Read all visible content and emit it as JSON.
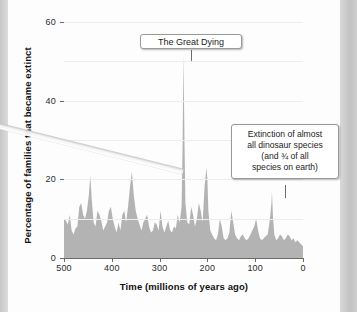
{
  "chart_data": {
    "type": "area",
    "title": "",
    "xlabel": "Time  (millions of years ago)",
    "ylabel": "Percentage of families that became extinct",
    "xlim": [
      500,
      0
    ],
    "ylim": [
      0,
      60
    ],
    "x_ticks": [
      "500",
      "400",
      "300",
      "200",
      "100",
      "0"
    ],
    "x_tick_values": [
      500,
      400,
      300,
      200,
      100,
      0
    ],
    "y_ticks": [
      "0",
      "20",
      "40",
      "60"
    ],
    "y_tick_values": [
      0,
      20,
      40,
      60
    ],
    "gridlines": [
      10,
      20,
      30,
      40,
      50,
      60
    ],
    "grid": true,
    "legend": "none",
    "series_name": "Extinction intensity",
    "fill_color": "#b3b3b3",
    "x": [
      500,
      496,
      492,
      488,
      484,
      480,
      476,
      472,
      468,
      464,
      460,
      456,
      452,
      448,
      445,
      442,
      438,
      434,
      430,
      426,
      422,
      418,
      414,
      410,
      406,
      402,
      398,
      394,
      390,
      386,
      382,
      378,
      374,
      370,
      366,
      362,
      358,
      354,
      350,
      346,
      342,
      338,
      334,
      330,
      326,
      322,
      318,
      314,
      310,
      306,
      302,
      298,
      294,
      290,
      286,
      282,
      278,
      274,
      270,
      266,
      262,
      258,
      254,
      252,
      250,
      248,
      246,
      242,
      238,
      234,
      230,
      226,
      222,
      218,
      214,
      210,
      206,
      202,
      200,
      198,
      194,
      190,
      186,
      182,
      178,
      174,
      170,
      166,
      162,
      158,
      154,
      150,
      146,
      142,
      138,
      134,
      130,
      126,
      122,
      118,
      114,
      110,
      106,
      102,
      98,
      94,
      90,
      86,
      82,
      78,
      74,
      70,
      66,
      65,
      63,
      60,
      56,
      52,
      48,
      44,
      40,
      36,
      32,
      28,
      24,
      20,
      16,
      12,
      8,
      4,
      0
    ],
    "y": [
      10,
      9.5,
      8.5,
      11,
      7,
      6,
      7.5,
      8,
      13,
      14,
      11,
      10,
      12,
      16,
      21,
      15,
      9,
      8,
      12,
      11,
      9.5,
      7,
      8,
      9,
      12,
      13,
      10,
      8,
      6.5,
      9,
      7,
      11,
      12,
      9,
      13,
      18,
      22,
      16,
      12,
      10,
      8.5,
      7,
      9,
      10,
      11,
      8,
      6.5,
      7,
      9,
      8.5,
      7,
      12,
      8,
      6.5,
      8,
      9.5,
      7,
      6.5,
      8,
      7.5,
      11,
      9,
      13,
      28,
      52,
      30,
      14,
      9,
      8.5,
      13,
      11,
      8,
      10,
      14,
      12,
      9,
      18,
      23,
      20,
      12,
      7,
      6,
      5,
      4.5,
      6,
      10,
      8,
      5,
      4.5,
      5,
      6.5,
      12,
      9,
      6,
      5,
      4.5,
      5.5,
      6,
      5,
      4.5,
      5,
      6,
      7,
      8,
      10,
      7,
      5,
      4.5,
      5,
      5.5,
      6,
      9,
      14,
      17,
      11,
      6,
      4.5,
      5,
      6,
      5.5,
      4.5,
      5,
      6,
      5.5,
      4.5,
      5,
      4,
      4.5,
      4,
      3.5,
      3
    ],
    "annotations": [
      {
        "name": "great-dying",
        "text": "The Great Dying",
        "points_to_x": 250,
        "points_to_value": 52
      },
      {
        "name": "kpg-extinction",
        "lines": [
          "Extinction of almost",
          "all dinosaur species",
          "(and ¾ of all",
          "species on earth)"
        ],
        "points_to_x": 65,
        "points_to_value": 17
      }
    ]
  },
  "axes": {
    "y_title": "Percentage of families that became extinct",
    "x_title": "Time  (millions of years ago)"
  }
}
